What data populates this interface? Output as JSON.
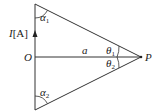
{
  "diagram": {
    "current_label_italic": "I",
    "current_label_unit": "[A]",
    "origin_label": "O",
    "distance_label": "a",
    "point_label": "P",
    "angles": {
      "alpha1": {
        "symbol": "α",
        "sub": "1"
      },
      "alpha2": {
        "symbol": "α",
        "sub": "2"
      },
      "theta1": {
        "symbol": "θ",
        "sub": "1"
      },
      "theta2": {
        "symbol": "θ",
        "sub": "2"
      }
    },
    "colors": {
      "line": "#333333",
      "background": "#ffffff"
    }
  }
}
